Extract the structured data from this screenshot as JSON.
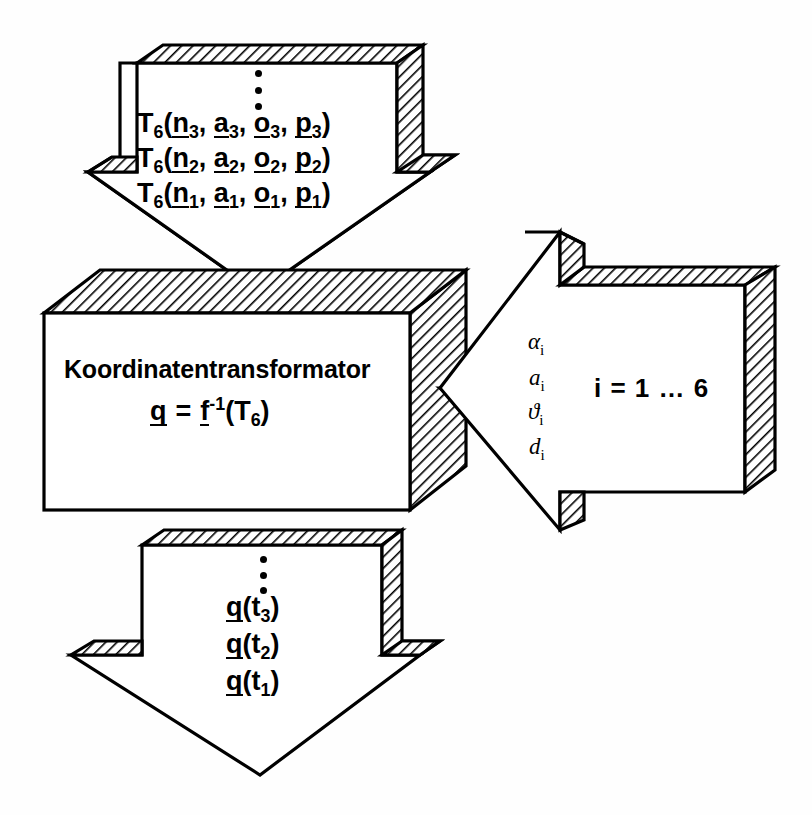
{
  "diagram": {
    "title": "Koordinatentransformator",
    "background_color": "#ffffff",
    "line_color": "#000000",
    "hatch_color": "#000000"
  },
  "central_block": {
    "name": "Koordinatentransformator",
    "label": "Koordinatentransformator",
    "equation": {
      "lhs_vector": "q",
      "equals": "=",
      "fn_vector": "f",
      "exponent": "-1",
      "open_paren": "(",
      "arg": "T",
      "arg_sub": "6",
      "close_paren": ")"
    }
  },
  "input_arrow": {
    "direction": "down",
    "ellipsis": "vertical-ellipsis",
    "lines": [
      {
        "fn": "T",
        "fn_sub": "6",
        "open": "(",
        "v1": "n",
        "v1_sub": "3",
        "sep1": ", ",
        "v2": "a",
        "v2_sub": "3",
        "sep2": ", ",
        "v3": "o",
        "v3_sub": "3",
        "sep3": ", ",
        "v4": "p",
        "v4_sub": "3",
        "close": ")"
      },
      {
        "fn": "T",
        "fn_sub": "6",
        "open": "(",
        "v1": "n",
        "v1_sub": "2",
        "sep1": ", ",
        "v2": "a",
        "v2_sub": "2",
        "sep2": ", ",
        "v3": "o",
        "v3_sub": "2",
        "sep3": ", ",
        "v4": "p",
        "v4_sub": "2",
        "close": ")"
      },
      {
        "fn": "T",
        "fn_sub": "6",
        "open": "(",
        "v1": "n",
        "v1_sub": "1",
        "sep1": ", ",
        "v2": "a",
        "v2_sub": "1",
        "sep2": ", ",
        "v3": "o",
        "v3_sub": "1",
        "sep3": ", ",
        "v4": "p",
        "v4_sub": "1",
        "close": ")"
      }
    ]
  },
  "parameter_arrow": {
    "direction": "left",
    "parameters": [
      {
        "symbol": "α",
        "index": "i"
      },
      {
        "symbol": "a",
        "index": "i"
      },
      {
        "symbol": "ϑ",
        "index": "i"
      },
      {
        "symbol": "d",
        "index": "i"
      }
    ],
    "range_label": "i = 1 … 6"
  },
  "output_arrow": {
    "direction": "down",
    "ellipsis": "vertical-ellipsis",
    "lines": [
      {
        "vec": "q",
        "open": "(",
        "arg": "t",
        "arg_sub": "3",
        "close": ")"
      },
      {
        "vec": "q",
        "open": "(",
        "arg": "t",
        "arg_sub": "2",
        "close": ")"
      },
      {
        "vec": "q",
        "open": "(",
        "arg": "t",
        "arg_sub": "1",
        "close": ")"
      }
    ]
  }
}
